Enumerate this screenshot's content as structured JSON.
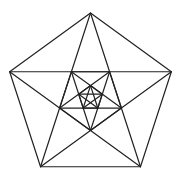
{
  "diagram": {
    "shape": "pentagon",
    "nesting_levels": 3,
    "includes_diagonals": true,
    "colors": {
      "stroke": "#222222",
      "background": "#ffffff"
    }
  }
}
